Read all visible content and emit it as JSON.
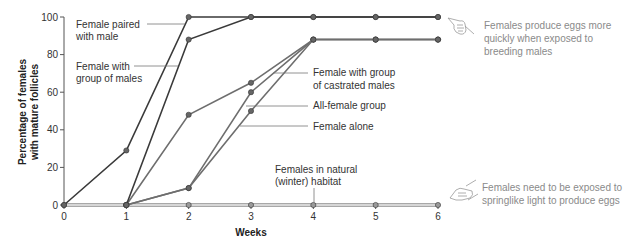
{
  "chart_data": {
    "type": "line",
    "title": "",
    "xlabel": "Weeks",
    "ylabel": "Percentage of females with mature follicles",
    "ylabel_lines": [
      "Percentage of females",
      "with mature follicles"
    ],
    "x": [
      0,
      1,
      2,
      3,
      4,
      5,
      6
    ],
    "x_ticks": [
      "0",
      "1",
      "2",
      "3",
      "4",
      "5",
      "6"
    ],
    "y_ticks": [
      "0",
      "20",
      "40",
      "60",
      "80",
      "100"
    ],
    "xlim": [
      0,
      6
    ],
    "ylim": [
      0,
      100
    ],
    "grid": false,
    "legend_position": "inline labels",
    "series": [
      {
        "name": "Female paired with male",
        "label_lines": [
          "Female paired",
          "with male"
        ],
        "color": "#3a3a3a",
        "values": [
          0,
          29,
          100,
          100,
          100,
          100,
          100
        ]
      },
      {
        "name": "Female with group of males",
        "label_lines": [
          "Female with",
          "group of males"
        ],
        "color": "#3a3a3a",
        "values": [
          null,
          0,
          88,
          100,
          100,
          100,
          100
        ]
      },
      {
        "name": "Female with group of castrated males",
        "label_lines": [
          "Female with group",
          "of castrated males"
        ],
        "color": "#6e6e6e",
        "values": [
          null,
          0,
          48,
          65,
          88,
          88,
          88
        ]
      },
      {
        "name": "All-female group",
        "label_lines": [
          "All-female group"
        ],
        "color": "#6e6e6e",
        "values": [
          null,
          0,
          9,
          60,
          88,
          88,
          88
        ]
      },
      {
        "name": "Female alone",
        "label_lines": [
          "Female alone"
        ],
        "color": "#6e6e6e",
        "values": [
          null,
          0,
          9,
          50,
          88,
          88,
          88
        ]
      },
      {
        "name": "Females in natural (winter) habitat",
        "label_lines": [
          "Females in natural",
          "(winter) habitat"
        ],
        "color": "#a8a8a8",
        "values": [
          0,
          0,
          0,
          0,
          0,
          0,
          0
        ]
      }
    ],
    "annotations": [
      {
        "icon": "pointing-hand-icon",
        "lines": [
          "Females produce eggs more",
          "quickly when exposed to",
          "breeding males"
        ]
      },
      {
        "icon": "pointing-hand-icon",
        "lines": [
          "Females need to be exposed to",
          "springlike light to produce eggs"
        ]
      }
    ]
  }
}
